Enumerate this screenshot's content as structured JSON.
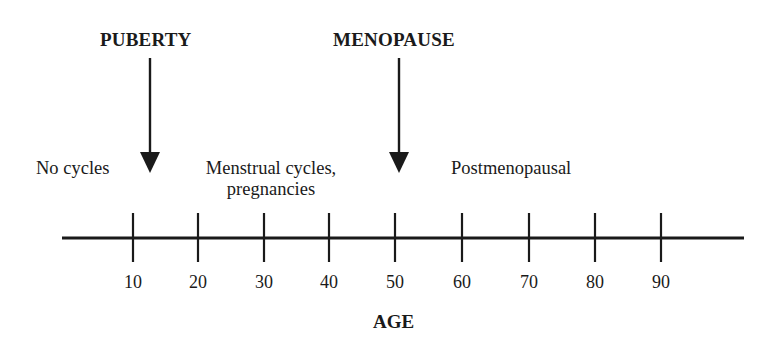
{
  "diagram": {
    "type": "timeline",
    "axis": {
      "title": "AGE",
      "ticks": [
        {
          "value": 10,
          "label": "10",
          "x": 133
        },
        {
          "value": 20,
          "label": "20",
          "x": 198
        },
        {
          "value": 30,
          "label": "30",
          "x": 264
        },
        {
          "value": 40,
          "label": "40",
          "x": 329
        },
        {
          "value": 50,
          "label": "50",
          "x": 395
        },
        {
          "value": 60,
          "label": "60",
          "x": 462
        },
        {
          "value": 70,
          "label": "70",
          "x": 529
        },
        {
          "value": 80,
          "label": "80",
          "x": 595
        },
        {
          "value": 90,
          "label": "90",
          "x": 661
        }
      ]
    },
    "events": [
      {
        "label": "PUBERTY",
        "approx_age": 12
      },
      {
        "label": "MENOPAUSE",
        "approx_age": 51
      }
    ],
    "phases": [
      {
        "label": "No cycles"
      },
      {
        "label_line1": "Menstrual cycles,",
        "label_line2": "pregnancies"
      },
      {
        "label": "Postmenopausal"
      }
    ],
    "colors": {
      "line": "#1a1a1a",
      "background": "#ffffff"
    }
  }
}
